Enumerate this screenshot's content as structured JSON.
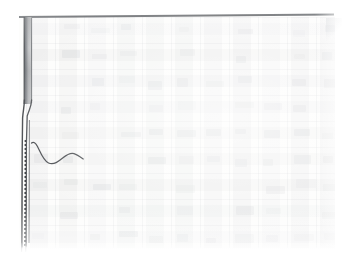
{
  "document": {
    "kind": "faded-scanned-page",
    "title": "",
    "visible_text": "",
    "note": ""
  },
  "canvas": {
    "width": 355,
    "height": 260,
    "background": "#ffffff",
    "paper_color": "#fdfdfc"
  },
  "marks": {
    "top_rule": {
      "name": "top-horizontal-rule",
      "color": "#4b4e52",
      "x_start": 19,
      "x_end": 334,
      "y": 16,
      "thickness": 2
    },
    "binding_bar": {
      "name": "dark-binding-edge",
      "color_dark": "#6a6d71",
      "color_light": "#e8e9ea",
      "x": 23,
      "y_top": 17,
      "y_bottom": 106,
      "width": 7
    },
    "kink": {
      "name": "spine-kink",
      "y": 106,
      "x_from": 30,
      "x_to": 24
    },
    "dashed_line": {
      "name": "dashed-vertical-line",
      "color": "#3f4246",
      "x": 27,
      "y_top": 140,
      "y_bottom": 246,
      "dash": "2 2"
    },
    "solid_lines": {
      "name": "vertical-rules",
      "color": "#55585c",
      "y_bottom": 247,
      "x_positions": [
        23,
        30
      ]
    },
    "curve": {
      "name": "handdrawn-wave-curve",
      "color": "#4a4d51",
      "x_start": 31,
      "x_end": 83,
      "y_peak": 146,
      "y_trough": 163,
      "y_end": 158
    },
    "corner_fold": {
      "name": "page-corner-fold",
      "x": 326,
      "y": 18
    }
  },
  "grid": {
    "name": "ghosted-table-grid",
    "origin_x": 26,
    "origin_y": 17,
    "width": 309,
    "height": 231,
    "column_pitch": 29,
    "column_count": 11,
    "row_pitch": 26,
    "row_count": 9,
    "ink_opacity": 0.09,
    "legible": false
  }
}
